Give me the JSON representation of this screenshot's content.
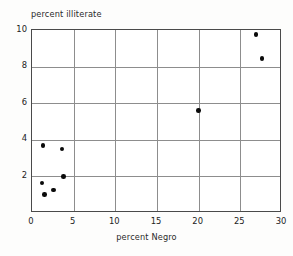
{
  "chart_data": {
    "type": "scatter",
    "title": "",
    "xlabel": "percent Negro",
    "ylabel": "percent illiterate",
    "xlim": [
      0,
      30
    ],
    "ylim": [
      0,
      10
    ],
    "grid": true,
    "legend": null,
    "xticks": [
      0,
      5,
      10,
      15,
      20,
      25,
      30
    ],
    "xtick_labels": [
      "0",
      "5",
      "10",
      "15",
      "20",
      "25",
      "30"
    ],
    "yticks": [
      2,
      4,
      6,
      8,
      10
    ],
    "ytick_labels": [
      "2",
      "4",
      "6",
      "8",
      "10"
    ],
    "marker": "filled-circle",
    "marker_color": "#0a0a0a",
    "points": [
      {
        "x": 1.3,
        "y": 3.7
      },
      {
        "x": 3.6,
        "y": 3.5
      },
      {
        "x": 3.8,
        "y": 2.0
      },
      {
        "x": 1.2,
        "y": 1.65
      },
      {
        "x": 2.6,
        "y": 1.25
      },
      {
        "x": 1.5,
        "y": 1.0
      },
      {
        "x": 20.0,
        "y": 5.6
      },
      {
        "x": 26.9,
        "y": 9.75
      },
      {
        "x": 27.6,
        "y": 8.45
      }
    ]
  },
  "axis": {
    "y_title": "percent illiterate",
    "x_title": "percent Negro"
  }
}
